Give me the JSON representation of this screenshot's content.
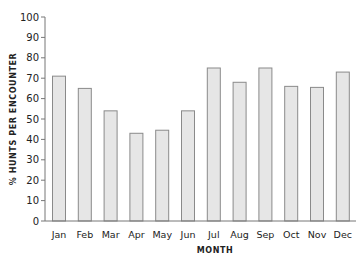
{
  "chart_data": {
    "type": "bar",
    "title": "",
    "xlabel": "MONTH",
    "ylabel": "% HUNTS PER ENCOUNTER",
    "categories": [
      "Jan",
      "Feb",
      "Mar",
      "Apr",
      "May",
      "Jun",
      "Jul",
      "Aug",
      "Sep",
      "Oct",
      "Nov",
      "Dec"
    ],
    "values": [
      71,
      65,
      54,
      43,
      44.5,
      54,
      75,
      68,
      75,
      66,
      65.5,
      73
    ],
    "ylim": [
      0,
      100
    ],
    "yticks": [
      0,
      10,
      20,
      30,
      40,
      50,
      60,
      70,
      80,
      90,
      100
    ],
    "grid": false,
    "legend": null
  },
  "colors": {
    "bar_fill": "#e6e6e6",
    "bar_stroke": "#8a8a8a",
    "axis": "#777777"
  }
}
